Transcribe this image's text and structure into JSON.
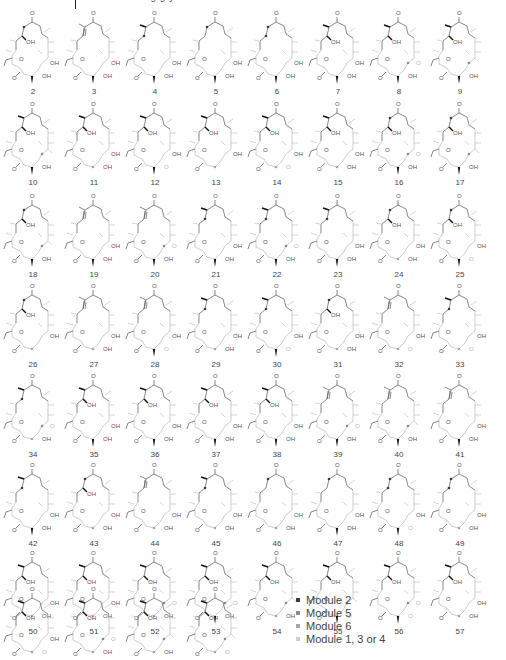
{
  "header": {
    "clipped_text": "…g g y …",
    "rule": true
  },
  "colors": {
    "module2": "#3a3a3a",
    "module5": "#8a8a8a",
    "module6": "#a6a6a6",
    "module134": "#d0d0d0",
    "bond_dark": "#555555",
    "bond_light": "#b8b8b8"
  },
  "legend": {
    "items": [
      {
        "label": "Module 2",
        "color": "#3a3a3a"
      },
      {
        "label": "Module 5",
        "color": "#8a8a8a"
      },
      {
        "label": "Module 6",
        "color": "#a6a6a6"
      },
      {
        "label": "Module 1, 3 or 4",
        "color": "#d0d0d0"
      }
    ]
  },
  "compounds": [
    {
      "n": "2",
      "x": 2,
      "y": 8,
      "top": "dot",
      "mid": "OH",
      "r1": "OH",
      "r2": "OH",
      "wedge": true
    },
    {
      "n": "3",
      "x": 63,
      "y": 8,
      "top": "ene",
      "mid": "",
      "r1": "OH",
      "r2": "OH",
      "wedge": true
    },
    {
      "n": "4",
      "x": 124,
      "y": 8,
      "top": "me",
      "mid": "dot",
      "r1": "OH",
      "r2": "OH",
      "wedge": true
    },
    {
      "n": "5",
      "x": 185,
      "y": 8,
      "top": "dot",
      "mid": "",
      "r1": "OH",
      "r2": "OH",
      "wedge": true
    },
    {
      "n": "6",
      "x": 246,
      "y": 8,
      "top": "dot",
      "mid": "dot",
      "r1": "OH",
      "r2": "OH",
      "wedge": true
    },
    {
      "n": "7",
      "x": 307,
      "y": 8,
      "top": "me",
      "mid": "OH",
      "r1": "OH",
      "r2": "OH",
      "wedge": true
    },
    {
      "n": "8",
      "x": 368,
      "y": 8,
      "top": "me",
      "mid": "OH",
      "r1": "O",
      "r2": "OH",
      "wedge": true
    },
    {
      "n": "9",
      "x": 429,
      "y": 8,
      "top": "me",
      "mid": "OH",
      "r1": "",
      "r2": "OH",
      "wedge": true
    },
    {
      "n": "10",
      "x": 2,
      "y": 99,
      "top": "me",
      "mid": "OH",
      "r1": "",
      "r2": "OH",
      "wedge": true
    },
    {
      "n": "11",
      "x": 63,
      "y": 99,
      "top": "me",
      "mid": "OH",
      "r1": "OH",
      "r2": "OH",
      "wedge": false
    },
    {
      "n": "12",
      "x": 124,
      "y": 99,
      "top": "me",
      "mid": "OH",
      "r1": "OH",
      "r2": "O",
      "wedge": true
    },
    {
      "n": "13",
      "x": 185,
      "y": 99,
      "top": "me",
      "mid": "OH",
      "r1": "OH",
      "r2": "",
      "wedge": false
    },
    {
      "n": "14",
      "x": 246,
      "y": 99,
      "top": "me",
      "mid": "OH",
      "r1": "OH",
      "r2": "O",
      "wedge": false
    },
    {
      "n": "15",
      "x": 307,
      "y": 99,
      "top": "me",
      "mid": "OH",
      "r1": "OH",
      "r2": "OH",
      "wedge": false
    },
    {
      "n": "16",
      "x": 368,
      "y": 99,
      "top": "dot",
      "mid": "OH",
      "r1": "O",
      "r2": "OH",
      "wedge": true
    },
    {
      "n": "17",
      "x": 429,
      "y": 99,
      "top": "dot",
      "mid": "OH",
      "r1": "",
      "r2": "OH",
      "wedge": true
    },
    {
      "n": "18",
      "x": 2,
      "y": 191,
      "top": "dot",
      "mid": "OH",
      "r1": "",
      "r2": "OH",
      "wedge": true
    },
    {
      "n": "19",
      "x": 63,
      "y": 191,
      "top": "ene",
      "mid": "",
      "r1": "OH",
      "r2": "OH",
      "wedge": true
    },
    {
      "n": "20",
      "x": 124,
      "y": 191,
      "top": "ene",
      "mid": "",
      "r1": "O",
      "r2": "OH",
      "wedge": true
    },
    {
      "n": "21",
      "x": 185,
      "y": 191,
      "top": "me",
      "mid": "dot",
      "r1": "OH",
      "r2": "OH",
      "wedge": true
    },
    {
      "n": "22",
      "x": 246,
      "y": 191,
      "top": "me",
      "mid": "dot",
      "r1": "O",
      "r2": "OH",
      "wedge": true
    },
    {
      "n": "23",
      "x": 307,
      "y": 191,
      "top": "me",
      "mid": "dot",
      "r1": "OH",
      "r2": "OH",
      "wedge": true
    },
    {
      "n": "24",
      "x": 368,
      "y": 191,
      "top": "dot",
      "mid": "OH",
      "r1": "OH",
      "r2": "OH",
      "wedge": false
    },
    {
      "n": "25",
      "x": 429,
      "y": 191,
      "top": "dot",
      "mid": "OH",
      "r1": "OH",
      "r2": "O",
      "wedge": true
    },
    {
      "n": "26",
      "x": 2,
      "y": 281,
      "top": "dot",
      "mid": "OH",
      "r1": "OH",
      "r2": "",
      "wedge": false
    },
    {
      "n": "27",
      "x": 63,
      "y": 281,
      "top": "ene",
      "mid": "",
      "r1": "OH",
      "r2": "OH",
      "wedge": false
    },
    {
      "n": "28",
      "x": 124,
      "y": 281,
      "top": "ene",
      "mid": "",
      "r1": "OH",
      "r2": "O",
      "wedge": true
    },
    {
      "n": "29",
      "x": 185,
      "y": 281,
      "top": "me",
      "mid": "dot",
      "r1": "OH",
      "r2": "OH",
      "wedge": false
    },
    {
      "n": "30",
      "x": 246,
      "y": 281,
      "top": "me",
      "mid": "dot",
      "r1": "OH",
      "r2": "O",
      "wedge": true
    },
    {
      "n": "31",
      "x": 307,
      "y": 281,
      "top": "dot",
      "mid": "OH",
      "r1": "OH",
      "r2": "OH",
      "wedge": false
    },
    {
      "n": "32",
      "x": 368,
      "y": 281,
      "top": "ene",
      "mid": "",
      "r1": "OH",
      "r2": "O",
      "wedge": false
    },
    {
      "n": "33",
      "x": 429,
      "y": 281,
      "top": "me",
      "mid": "dot",
      "r1": "OH",
      "r2": "O",
      "wedge": false
    },
    {
      "n": "34",
      "x": 2,
      "y": 371,
      "top": "me",
      "mid": "dot",
      "r1": "O",
      "r2": "OH",
      "wedge": false
    },
    {
      "n": "35",
      "x": 63,
      "y": 371,
      "top": "me",
      "mid": "OH",
      "r1": "OH",
      "r2": "OH",
      "wedge": true
    },
    {
      "n": "36",
      "x": 124,
      "y": 371,
      "top": "me",
      "mid": "OH",
      "r1": "OH",
      "r2": "OH",
      "wedge": true
    },
    {
      "n": "37",
      "x": 185,
      "y": 371,
      "top": "me",
      "mid": "OH",
      "r1": "OH",
      "r2": "OH",
      "wedge": true
    },
    {
      "n": "38",
      "x": 246,
      "y": 371,
      "top": "me",
      "mid": "OH",
      "r1": "OH",
      "r2": "OH",
      "wedge": true
    },
    {
      "n": "39",
      "x": 307,
      "y": 371,
      "top": "ene",
      "mid": "",
      "r1": "O",
      "r2": "OH",
      "wedge": true
    },
    {
      "n": "40",
      "x": 368,
      "y": 371,
      "top": "ene",
      "mid": "",
      "r1": "",
      "r2": "OH",
      "wedge": true
    },
    {
      "n": "41",
      "x": 429,
      "y": 371,
      "top": "ene",
      "mid": "",
      "r1": "OH",
      "r2": "OH",
      "wedge": true
    },
    {
      "n": "42",
      "x": 2,
      "y": 460,
      "top": "me",
      "mid": "dot",
      "r1": "OH",
      "r2": "OH",
      "wedge": true
    },
    {
      "n": "43",
      "x": 63,
      "y": 460,
      "top": "dot",
      "mid": "OH",
      "r1": "OH",
      "r2": "OH",
      "wedge": false
    },
    {
      "n": "44",
      "x": 124,
      "y": 460,
      "top": "ene",
      "mid": "",
      "r1": "OH",
      "r2": "OH",
      "wedge": false
    },
    {
      "n": "45",
      "x": 185,
      "y": 460,
      "top": "me",
      "mid": "dot",
      "r1": "OH",
      "r2": "OH",
      "wedge": false
    },
    {
      "n": "46",
      "x": 246,
      "y": 460,
      "top": "dot",
      "mid": "",
      "r1": "OH",
      "r2": "OH",
      "wedge": false
    },
    {
      "n": "47",
      "x": 307,
      "y": 460,
      "top": "dot",
      "mid": "",
      "r1": "OH",
      "r2": "OH",
      "wedge": true
    },
    {
      "n": "48",
      "x": 368,
      "y": 460,
      "top": "dot",
      "mid": "dot",
      "r1": "OH",
      "r2": "O",
      "wedge": true
    },
    {
      "n": "49",
      "x": 429,
      "y": 460,
      "top": "dot",
      "mid": "dot",
      "r1": "OH",
      "r2": "OH",
      "wedge": false
    },
    {
      "n": "50",
      "x": 2,
      "y": 548,
      "top": "me",
      "mid": "OH",
      "r1": "OH",
      "r2": "OH",
      "wedge": false
    },
    {
      "n": "51",
      "x": 63,
      "y": 548,
      "top": "me",
      "mid": "OH",
      "r1": "OH",
      "r2": "OH",
      "wedge": false
    },
    {
      "n": "52",
      "x": 124,
      "y": 548,
      "top": "me",
      "mid": "OH",
      "r1": "O",
      "r2": "OH",
      "wedge": false
    },
    {
      "n": "53",
      "x": 185,
      "y": 548,
      "top": "me",
      "mid": "OH",
      "r1": "O",
      "r2": "OH",
      "wedge": true
    },
    {
      "n": "54",
      "x": 246,
      "y": 548,
      "top": "me",
      "mid": "OH",
      "r1": "",
      "r2": "OH",
      "wedge": false
    },
    {
      "n": "55",
      "x": 307,
      "y": 548,
      "top": "me",
      "mid": "OH",
      "r1": "",
      "r2": "O",
      "wedge": true
    },
    {
      "n": "56",
      "x": 368,
      "y": 548,
      "top": "me",
      "mid": "OH",
      "r1": "O",
      "r2": "O",
      "wedge": true
    },
    {
      "n": "57",
      "x": 429,
      "y": 548,
      "top": "me",
      "mid": "OH",
      "r1": "OH",
      "r2": "OH",
      "wedge": false
    },
    {
      "n": "58",
      "x": 2,
      "y": 584,
      "top": "me",
      "mid": "OH",
      "r1": "OH",
      "r2": "O",
      "wedge": false
    },
    {
      "n": "59",
      "x": 63,
      "y": 584,
      "top": "me",
      "mid": "OH",
      "r1": "O",
      "r2": "OH",
      "wedge": false
    },
    {
      "n": "60",
      "x": 124,
      "y": 584,
      "top": "me",
      "mid": "OH",
      "r1": "",
      "r2": "OH",
      "wedge": false
    },
    {
      "n": "61",
      "x": 185,
      "y": 584,
      "top": "me",
      "mid": "OH",
      "r1": "",
      "r2": "O",
      "wedge": false
    }
  ]
}
